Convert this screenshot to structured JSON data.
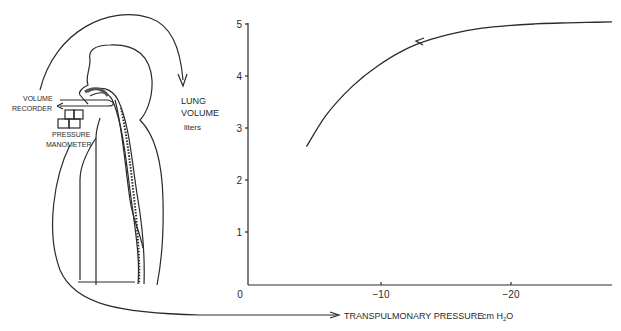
{
  "figure": {
    "diagram": {
      "labels": {
        "volume_recorder_line1": "VOLUME",
        "volume_recorder_line2": "RECORDER",
        "pressure_manometer_line1": "PRESSURE",
        "pressure_manometer_line2": "MANOMETER"
      }
    },
    "y_axis": {
      "label_line1": "LUNG",
      "label_line2": "VOLUME",
      "units": "liters",
      "ticks": [
        "0",
        "1",
        "2",
        "3",
        "4",
        "5"
      ]
    },
    "x_axis": {
      "label": "TRANSPULMONARY PRESSURE",
      "units_prefix": "cm H",
      "units_sub": "2",
      "units_suffix": "O",
      "ticks": [
        "0",
        "−10",
        "−20"
      ]
    },
    "colors": {
      "ink": "#2a2a2a",
      "background": "#ffffff"
    }
  },
  "chart_data": {
    "type": "line",
    "title": "",
    "xlabel": "TRANSPULMONARY PRESSURE cm H2O",
    "ylabel": "LUNG VOLUME liters",
    "xlim": [
      0,
      -28
    ],
    "ylim": [
      0,
      5
    ],
    "x_ticks": [
      0,
      -10,
      -20
    ],
    "y_ticks": [
      0,
      1,
      2,
      3,
      4,
      5
    ],
    "grid": false,
    "legend": null,
    "series": [
      {
        "name": "Pressure-volume curve (deflation, arrow pointing toward lower pressure)",
        "x": [
          -4.5,
          -6,
          -8,
          -10,
          -12,
          -14,
          -16,
          -18,
          -20,
          -22,
          -24,
          -26,
          -28
        ],
        "y": [
          2.65,
          3.25,
          3.8,
          4.2,
          4.5,
          4.7,
          4.83,
          4.92,
          4.97,
          5.0,
          5.02,
          5.03,
          5.04
        ]
      }
    ],
    "annotations": [
      "arrow on curve near x=-13 pointing left/down along curve",
      "schematic of subject connected to volume recorder and pressure manometer"
    ]
  }
}
